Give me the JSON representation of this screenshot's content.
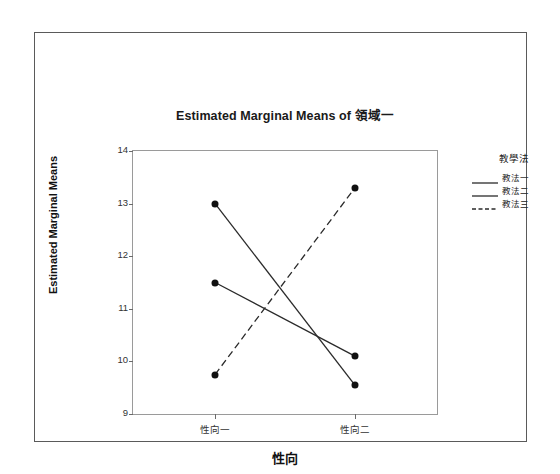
{
  "chart_data": {
    "type": "line",
    "title": "Estimated Marginal Means of 領域一",
    "xlabel": "性向",
    "ylabel": "Estimated Marginal Means",
    "categories": [
      "性向一",
      "性向二"
    ],
    "ylim": [
      9,
      14
    ],
    "yticks": [
      9,
      10,
      11,
      12,
      13,
      14
    ],
    "ytick_labels": [
      "9",
      "10",
      "11",
      "12",
      "13",
      "14"
    ],
    "grid": false,
    "legend_position": "right",
    "legend_title": "教學法",
    "series": [
      {
        "name": "教法一",
        "values": [
          13.0,
          9.55
        ],
        "style": "solid",
        "color": "#2a2a2a"
      },
      {
        "name": "教法二",
        "values": [
          11.5,
          10.1
        ],
        "style": "solid",
        "color": "#2a2a2a"
      },
      {
        "name": "教法三",
        "values": [
          9.75,
          13.3
        ],
        "style": "dashed",
        "color": "#2a2a2a"
      }
    ]
  },
  "legend": {
    "title": "教學法",
    "entries": [
      {
        "label": "教法一",
        "style": "solid"
      },
      {
        "label": "教法二",
        "style": "solid"
      },
      {
        "label": "教法三",
        "style": "dashed"
      }
    ]
  },
  "axes": {
    "y_title": "Estimated Marginal Means",
    "x_title": "性向"
  }
}
